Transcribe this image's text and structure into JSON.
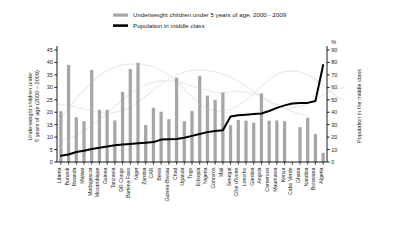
{
  "legend": {
    "bars_label": "Underweight children under 5 years of age, 2000 - 2009",
    "line_label": "Population in middle class"
  },
  "axes": {
    "left_title": "Underweight children under 5 years of age (2000 – 2009)",
    "left_title_line1": "Underweight children under",
    "left_title_line2": "5 years of age (2000 – 2009)",
    "right_title": "Population in the middle class",
    "right_unit": "%"
  },
  "colors": {
    "bar": "#a6a6a6",
    "line": "#000000",
    "axis": "#000000",
    "text": "#1a1a1a",
    "watermark": "#e9e9e9"
  },
  "chart_data": {
    "type": "bar",
    "title": "",
    "subtitle": "",
    "xlabel": "",
    "ylabel": "Underweight children under 5 years of age (2000 – 2009)",
    "y2label": "Population in the middle class",
    "ylim": [
      0,
      45
    ],
    "y2lim": [
      0,
      90
    ],
    "yticks": [
      0,
      5,
      10,
      15,
      20,
      25,
      30,
      35,
      40,
      45
    ],
    "y2ticks": [
      0,
      10,
      20,
      30,
      40,
      50,
      60,
      70,
      80,
      90
    ],
    "grid": false,
    "legend_position": "top",
    "categories": [
      "Liberia",
      "Burundi",
      "Rwanda",
      "Malawi",
      "Madagascar",
      "Mozambique",
      "Guinea",
      "Tanzania",
      "DR Congo",
      "Burkina Faso",
      "Niger",
      "Zambia",
      "CAR",
      "Benin",
      "Guinea-Bissau",
      "Chad",
      "Uganda",
      "Togo",
      "Ethiopia",
      "Nigeria",
      "Comoros",
      "Mali",
      "Senegal",
      "Côte d'Ivoire",
      "Lesotho",
      "Gambia",
      "Angola",
      "Cameroon",
      "Mauritania",
      "Kenya",
      "Cabo Verde",
      "Ghana",
      "Namibia",
      "Botswana",
      "Algeria"
    ],
    "series": [
      {
        "name": "Underweight children under 5 years of age, 2000 - 2009",
        "type": "bar",
        "axis": "left",
        "unit": "%",
        "values": [
          20.4,
          39.0,
          18.0,
          16.4,
          37.0,
          21.0,
          21.0,
          16.7,
          28.2,
          37.3,
          39.9,
          14.9,
          21.8,
          20.2,
          17.2,
          33.9,
          16.4,
          20.5,
          34.6,
          26.7,
          25.0,
          27.9,
          14.8,
          16.9,
          16.6,
          15.8,
          27.6,
          16.6,
          16.7,
          16.4,
          null,
          14.0,
          17.8,
          11.2,
          3.7
        ]
      },
      {
        "name": "Population in middle class",
        "type": "line",
        "axis": "right",
        "unit": "%",
        "values": [
          5.0,
          6.0,
          8.0,
          9.0,
          10.5,
          11.5,
          12.5,
          13.5,
          14.0,
          14.5,
          15.0,
          15.5,
          16.0,
          18.0,
          18.2,
          18.5,
          19.5,
          21.0,
          22.5,
          24.0,
          25.0,
          25.5,
          36.5,
          37.5,
          38.0,
          38.5,
          39.0,
          41.0,
          43.5,
          45.5,
          47.0,
          47.5,
          47.5,
          49.0,
          78.0
        ]
      }
    ]
  }
}
